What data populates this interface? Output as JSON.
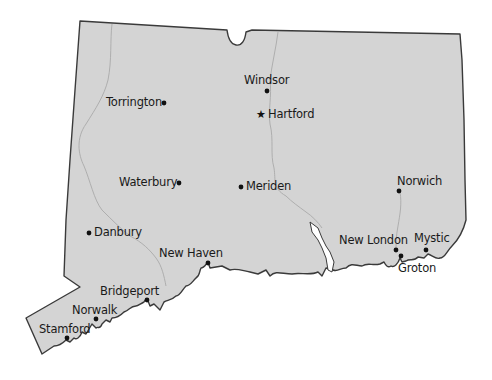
{
  "map": {
    "region": "Connecticut",
    "colors": {
      "land": "#d4d4d4",
      "border": "#3a3a3a",
      "river": "#a9a9a9",
      "water": "#ffffff",
      "marker": "#111111"
    },
    "capital": {
      "name": "Hartford",
      "marker": "star-icon"
    },
    "cities": [
      {
        "name": "Windsor",
        "label_pos": "above"
      },
      {
        "name": "Hartford",
        "label_pos": "right",
        "capital": true
      },
      {
        "name": "Torrington",
        "label_pos": "left"
      },
      {
        "name": "Waterbury",
        "label_pos": "left"
      },
      {
        "name": "Meriden",
        "label_pos": "right"
      },
      {
        "name": "Norwich",
        "label_pos": "above"
      },
      {
        "name": "Danbury",
        "label_pos": "right"
      },
      {
        "name": "New Haven",
        "label_pos": "above"
      },
      {
        "name": "New London",
        "label_pos": "above"
      },
      {
        "name": "Mystic",
        "label_pos": "above"
      },
      {
        "name": "Groton",
        "label_pos": "below"
      },
      {
        "name": "Bridgeport",
        "label_pos": "above"
      },
      {
        "name": "Norwalk",
        "label_pos": "above"
      },
      {
        "name": "Stamford",
        "label_pos": "above"
      }
    ]
  }
}
